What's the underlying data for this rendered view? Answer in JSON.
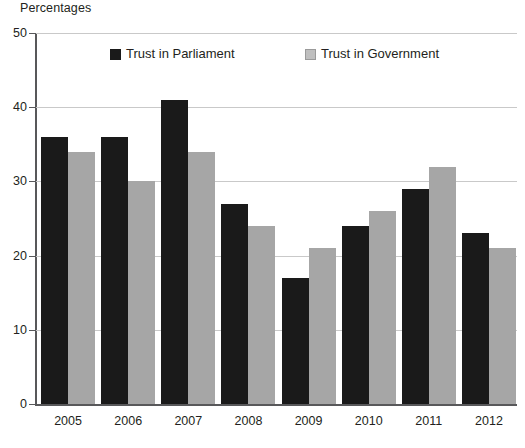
{
  "chart_data": {
    "type": "bar",
    "title": "",
    "ylabel": "Percentages",
    "xlabel": "",
    "categories": [
      "2005",
      "2006",
      "2007",
      "2008",
      "2009",
      "2010",
      "2011",
      "2012"
    ],
    "series": [
      {
        "name": "Trust in Parliament",
        "color": "#1a1a1a",
        "values": [
          36,
          36,
          41,
          27,
          17,
          24,
          29,
          23
        ]
      },
      {
        "name": "Trust in Government",
        "color": "#a6a6a6",
        "values": [
          34,
          30,
          34,
          24,
          21,
          26,
          32,
          21
        ]
      }
    ],
    "ylim": [
      0,
      50
    ],
    "yticks": [
      0,
      10,
      20,
      30,
      40,
      50
    ],
    "ytick_labels": [
      "0",
      "10",
      "20",
      "30",
      "40",
      "50"
    ],
    "grid": true,
    "grid_axis": "y",
    "legend_position": "top-inside",
    "background": "#ffffff",
    "axis_color": "#58585a",
    "grid_color": "#c9c9c9"
  },
  "axis": {
    "y_title": "Percentages"
  },
  "legend": {
    "entries": [
      {
        "label": "Trust in Parliament"
      },
      {
        "label": "Trust in Government"
      }
    ]
  }
}
